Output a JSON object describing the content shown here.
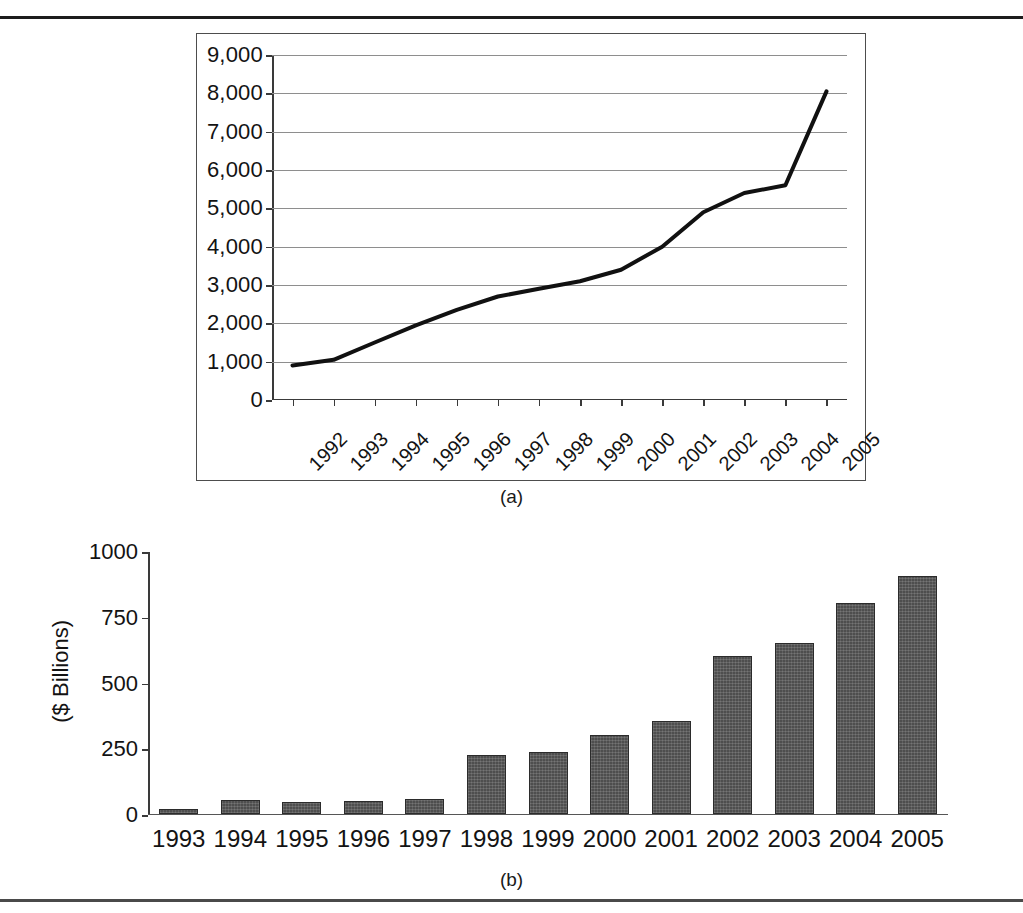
{
  "figure": {
    "caption_a": "(a)",
    "caption_b": "(b)"
  },
  "chart_data": [
    {
      "panel": "a",
      "type": "line",
      "title": "",
      "xlabel": "",
      "ylabel": "",
      "ylim": [
        0,
        9000
      ],
      "yticks": [
        "0",
        "1,000",
        "2,000",
        "3,000",
        "4,000",
        "5,000",
        "6,000",
        "7,000",
        "8,000",
        "9,000"
      ],
      "ytick_values": [
        0,
        1000,
        2000,
        3000,
        4000,
        5000,
        6000,
        7000,
        8000,
        9000
      ],
      "grid": true,
      "legend": "none",
      "categories": [
        "1992",
        "1993",
        "1994",
        "1995",
        "1996",
        "1997",
        "1998",
        "1999",
        "2000",
        "2001",
        "2002",
        "2003",
        "2004",
        "2005"
      ],
      "values": [
        900,
        1050,
        1500,
        1950,
        2350,
        2700,
        2900,
        3100,
        3400,
        4000,
        4900,
        5400,
        5600,
        7000
      ],
      "values_full": [
        900,
        1050,
        1500,
        1950,
        2350,
        2700,
        2900,
        3100,
        3400,
        4000,
        4900,
        5400,
        5600,
        8050
      ],
      "line_color": "#111111"
    },
    {
      "panel": "b",
      "type": "bar",
      "title": "",
      "xlabel": "",
      "ylabel": "($ Billions)",
      "ylim": [
        0,
        1000
      ],
      "yticks": [
        "0",
        "250",
        "500",
        "750",
        "1000"
      ],
      "ytick_values": [
        0,
        250,
        500,
        750,
        1000
      ],
      "grid": false,
      "legend": "none",
      "categories": [
        "1993",
        "1994",
        "1995",
        "1996",
        "1997",
        "1998",
        "1999",
        "2000",
        "2001",
        "2002",
        "2003",
        "2004",
        "2005"
      ],
      "values": [
        18,
        50,
        45,
        48,
        55,
        222,
        232,
        300,
        350,
        600,
        650,
        800,
        905
      ],
      "bar_color": "#4e4e4e"
    }
  ]
}
